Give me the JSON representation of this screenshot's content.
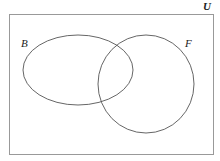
{
  "diagram": {
    "type": "venn",
    "universe_label": "U",
    "sets": [
      {
        "label": "B",
        "shape": "ellipse",
        "cx": 78,
        "cy": 70,
        "rx": 55,
        "ry": 35
      },
      {
        "label": "F",
        "shape": "ellipse",
        "cx": 146,
        "cy": 84,
        "rx": 48,
        "ry": 49
      }
    ],
    "colors": {
      "stroke": "#555555",
      "border": "#999999",
      "text": "#222222"
    }
  }
}
